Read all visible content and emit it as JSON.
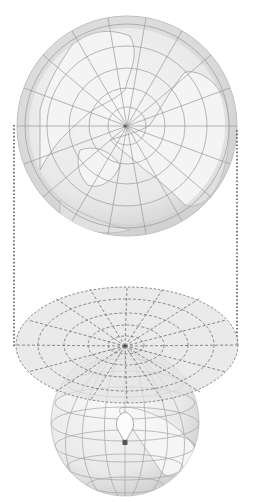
{
  "diagram": {
    "title": "",
    "colors": {
      "background": "#ffffff",
      "disc_fill": "#e6e6e6",
      "disc_rim": "#cfcfcf",
      "land": "#f3f3f3",
      "graticule": "#9a9a9a",
      "coast": "#8c8c8c",
      "plane_fill": "#e4e4e4",
      "plane_dash": "#7a7a7a",
      "dotted_line": "#333333",
      "bulb": "#555555"
    },
    "top_map": {
      "cx": 127,
      "cy": 126,
      "r": 110,
      "parallels": [
        22,
        44,
        66,
        88,
        110
      ],
      "meridians": 18
    },
    "projection_lines": {
      "left_x": 14,
      "right_x": 237,
      "y_top_left": 125,
      "y_top_right": 130,
      "y_bottom": 348
    },
    "plane": {
      "cx": 127,
      "cy": 345,
      "rx": 111,
      "ry": 58
    },
    "globe": {
      "cx": 125,
      "cy": 422,
      "r": 74
    },
    "pole_point": {
      "x": 125,
      "y": 346
    },
    "light_source": {
      "x": 125,
      "y": 440,
      "label": ""
    }
  }
}
